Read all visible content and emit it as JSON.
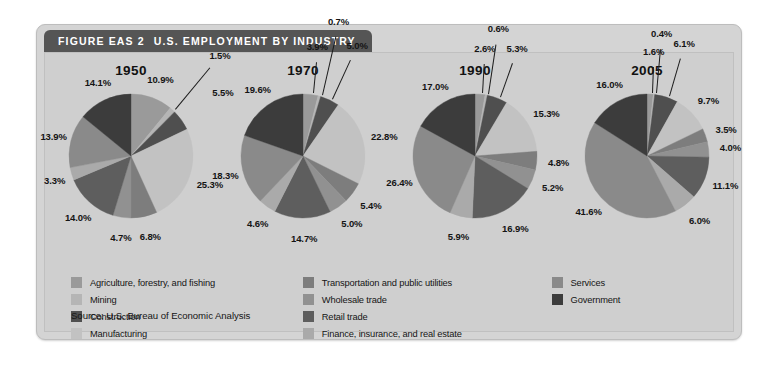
{
  "figure": {
    "number_label": "FIGURE EAS 2",
    "title": "U.S. EMPLOYMENT BY INDUSTRY",
    "source": "Source: U.S. Bureau of Economic Analysis",
    "panel_bg": "#cfcfcf",
    "title_bar_bg": "#555555",
    "title_bar_text_color": "#ffffff"
  },
  "legend": {
    "columns": [
      {
        "items": [
          {
            "label": "Agriculture, forestry, and fishing",
            "color": "#9a9a9a"
          },
          {
            "label": "Mining",
            "color": "#b5b5b5"
          },
          {
            "label": "Construction",
            "color": "#4f4f4f"
          },
          {
            "label": "Manufacturing",
            "color": "#c2c2c2"
          }
        ]
      },
      {
        "items": [
          {
            "label": "Transportation and public utilities",
            "color": "#7d7d7d"
          },
          {
            "label": "Wholesale trade",
            "color": "#919191"
          },
          {
            "label": "Retail trade",
            "color": "#5e5e5e"
          },
          {
            "label": "Finance, insurance, and real estate",
            "color": "#aaaaaa"
          }
        ]
      },
      {
        "items": [
          {
            "label": "Services",
            "color": "#8a8a8a"
          },
          {
            "label": "Government",
            "color": "#3c3c3c"
          }
        ]
      }
    ]
  },
  "chart_data": {
    "type": "pie",
    "title": "U.S. EMPLOYMENT BY INDUSTRY",
    "subtitle": "",
    "xlabel": "",
    "ylabel": "",
    "legend_position": "bottom",
    "grid": false,
    "units": "percent",
    "categories": [
      "Agriculture, forestry, and fishing",
      "Mining",
      "Construction",
      "Manufacturing",
      "Transportation and public utilities",
      "Wholesale trade",
      "Retail trade",
      "Finance, insurance, and real estate",
      "Services",
      "Government"
    ],
    "category_colors": [
      "#9a9a9a",
      "#b5b5b5",
      "#4f4f4f",
      "#c2c2c2",
      "#7d7d7d",
      "#919191",
      "#5e5e5e",
      "#aaaaaa",
      "#8a8a8a",
      "#3c3c3c"
    ],
    "series": [
      {
        "name": "1950",
        "values": [
          10.9,
          1.5,
          5.5,
          25.3,
          6.8,
          4.7,
          14.0,
          3.3,
          13.9,
          14.1
        ]
      },
      {
        "name": "1970",
        "values": [
          3.9,
          0.7,
          5.0,
          22.8,
          5.4,
          5.0,
          14.7,
          4.6,
          18.3,
          19.6
        ]
      },
      {
        "name": "1990",
        "values": [
          2.6,
          0.6,
          5.3,
          15.3,
          4.8,
          5.2,
          16.9,
          5.9,
          26.4,
          17.0
        ]
      },
      {
        "name": "2005",
        "values": [
          1.6,
          0.4,
          6.1,
          9.7,
          3.5,
          4.0,
          11.1,
          6.0,
          41.6,
          16.0
        ]
      }
    ],
    "labels": {
      "1950": [
        "10.9%",
        "1.5%",
        "5.5%",
        "25.3%",
        "6.8%",
        "4.7%",
        "14.0%",
        "3.3%",
        "13.9%",
        "14.1%"
      ],
      "1970": [
        "3.9%",
        "0.7%",
        "5.0%",
        "22.8%",
        "5.4%",
        "5.0%",
        "14.7%",
        "4.6%",
        "18.3%",
        "19.6%"
      ],
      "1990": [
        "2.6%",
        "0.6%",
        "5.3%",
        "15.3%",
        "4.8%",
        "5.2%",
        "16.9%",
        "5.9%",
        "26.4%",
        "17.0%"
      ],
      "2005": [
        "1.6%",
        "0.4%",
        "6.1%",
        "9.7%",
        "3.5%",
        "4.0%",
        "11.1%",
        "6.0%",
        "41.6%",
        "16.0%"
      ]
    }
  }
}
